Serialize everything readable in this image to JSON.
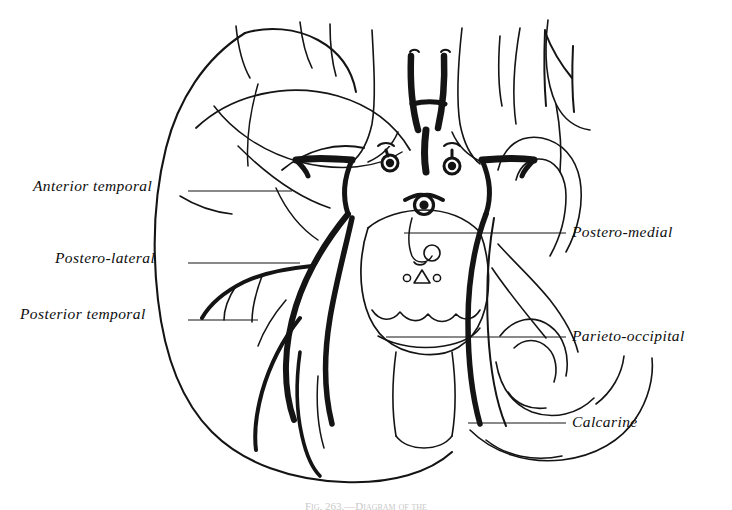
{
  "figure": {
    "type": "anatomical-line-drawing",
    "background_color": "#ffffff",
    "ink_color": "#111111",
    "caption": "Fig. 263.—Diagram of the"
  },
  "labels_left": [
    {
      "text": "Anterior temporal",
      "x": 33,
      "y": 178,
      "leader_y": 191,
      "leader_x1": 188,
      "leader_x2": 292
    },
    {
      "text": "Postero-lateral",
      "x": 55,
      "y": 250,
      "leader_y": 263,
      "leader_x1": 188,
      "leader_x2": 300
    },
    {
      "text": "Posterior temporal",
      "x": 20,
      "y": 306,
      "leader_y": 320,
      "leader_x1": 188,
      "leader_x2": 258
    }
  ],
  "labels_right": [
    {
      "text": "Postero-medial",
      "x": 572,
      "y": 226,
      "leader_y": 233,
      "leader_x1": 404,
      "leader_x2": 566
    },
    {
      "text": "Parieto-occipital",
      "x": 572,
      "y": 329,
      "leader_y": 337,
      "leader_x1": 386,
      "leader_x2": 566
    },
    {
      "text": "Calcarine",
      "x": 572,
      "y": 415,
      "leader_y": 423,
      "leader_x1": 468,
      "leader_x2": 566
    }
  ],
  "structures": [
    {
      "name": "left-cerebral-hemisphere",
      "description": "Large ovoid outline of the temporal and occipital lobe, left side"
    },
    {
      "name": "vertebral-arteries",
      "description": "Paired vertical trunks at top with transverse connecting branch"
    },
    {
      "name": "basilar-artery",
      "description": "Midline trunk formed by union of vertebral arteries"
    },
    {
      "name": "circle-of-willis",
      "description": "Arterial ring with posterior communicating and posterior cerebral arteries"
    },
    {
      "name": "brain-stem",
      "description": "Pons and midbrain with cerebral peduncles and small nuclei markings"
    },
    {
      "name": "posterior-cerebral-artery",
      "description": "Heavy curved vessel branching over the temporo-occipital cortex"
    },
    {
      "name": "cerebellar-convolutions",
      "description": "Folded gyral outlines on the right half of the plate"
    },
    {
      "name": "calcarine-sulcus",
      "description": "Deep fissure on the medial occipital surface"
    }
  ]
}
